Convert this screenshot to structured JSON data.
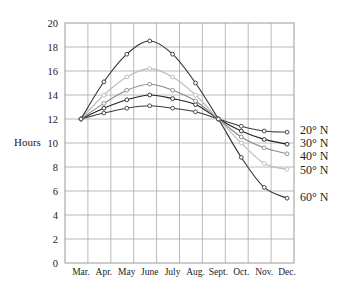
{
  "chart_data": {
    "type": "line",
    "title": "",
    "xlabel": "",
    "ylabel": "Hours",
    "ylim": [
      0,
      20
    ],
    "yticks": [
      0,
      2,
      4,
      6,
      8,
      10,
      12,
      14,
      16,
      18,
      20
    ],
    "grid": true,
    "legend_position": "right, inline labels at line ends",
    "categories": [
      "Mar.",
      "Apr.",
      "May",
      "June",
      "July",
      "Aug.",
      "Sept.",
      "Oct.",
      "Nov.",
      "Dec."
    ],
    "series": [
      {
        "name": "20° N",
        "color": "#3a3a3a",
        "values": [
          12.0,
          12.5,
          12.9,
          13.1,
          12.9,
          12.6,
          12.0,
          11.4,
          11.0,
          10.9
        ]
      },
      {
        "name": "30° N",
        "color": "#222222",
        "values": [
          12.0,
          12.9,
          13.6,
          14.0,
          13.7,
          13.2,
          12.0,
          11.0,
          10.3,
          9.9
        ]
      },
      {
        "name": "40° N",
        "color": "#888888",
        "values": [
          12.0,
          13.3,
          14.4,
          14.9,
          14.4,
          13.5,
          12.0,
          10.5,
          9.6,
          9.1
        ]
      },
      {
        "name": "50° N",
        "color": "#bbbbbb",
        "values": [
          12.0,
          14.0,
          15.5,
          16.2,
          15.5,
          14.0,
          12.0,
          10.0,
          8.3,
          7.8
        ]
      },
      {
        "name": "60° N",
        "color": "#333333",
        "values": [
          12.0,
          15.1,
          17.4,
          18.5,
          17.4,
          15.0,
          12.0,
          8.8,
          6.3,
          5.4
        ]
      }
    ],
    "legend_label_y": {
      "20° N": 130,
      "30° N": 143,
      "40° N": 156,
      "50° N": 170,
      "60° N": 197
    }
  }
}
